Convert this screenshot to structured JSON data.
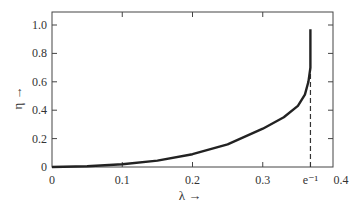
{
  "chart_data": {
    "type": "line",
    "title": "",
    "xlabel": "λ →",
    "ylabel": "η →",
    "xlim": [
      0,
      0.4
    ],
    "ylim": [
      0,
      1.08
    ],
    "x_ticks": [
      {
        "value": 0,
        "label": "0"
      },
      {
        "value": 0.1,
        "label": "0.1"
      },
      {
        "value": 0.2,
        "label": "0.2"
      },
      {
        "value": 0.3,
        "label": "0.3"
      },
      {
        "value": 0.3679,
        "label": "e⁻¹"
      },
      {
        "value": 0.4,
        "label": "0.4"
      }
    ],
    "y_ticks": [
      {
        "value": 0,
        "label": "0"
      },
      {
        "value": 0.2,
        "label": "0.2"
      },
      {
        "value": 0.4,
        "label": "0.4"
      },
      {
        "value": 0.6,
        "label": "0.6"
      },
      {
        "value": 0.8,
        "label": "0.8"
      },
      {
        "value": 1.0,
        "label": "1.0"
      }
    ],
    "grid": false,
    "series": [
      {
        "name": "η(λ)",
        "x": [
          0,
          0.05,
          0.1,
          0.15,
          0.2,
          0.25,
          0.3,
          0.33,
          0.35,
          0.36,
          0.365,
          0.3679,
          0.3679
        ],
        "y": [
          0,
          0.005,
          0.02,
          0.045,
          0.09,
          0.16,
          0.27,
          0.35,
          0.43,
          0.51,
          0.6,
          0.7,
          0.97
        ]
      }
    ],
    "annotations": [
      {
        "type": "vline",
        "x": 0.3679,
        "style": "dashed",
        "from_y": 0,
        "to_y": 0.7,
        "label": "e⁻¹"
      }
    ]
  }
}
